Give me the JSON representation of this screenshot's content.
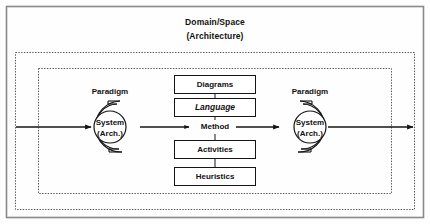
{
  "figure": {
    "title_line1": "Domain/Space",
    "title_line2": "(Architecture)",
    "colors": {
      "stroke": "#141414",
      "frame": "#8a8a8a",
      "background": "#fefefe",
      "dashed": "#555555"
    }
  },
  "left_node": {
    "paradigm_label": "Paradigm",
    "system_line1": "System",
    "system_line2": "(Arch.)"
  },
  "right_node": {
    "paradigm_label": "Paradigm",
    "system_line1": "System",
    "system_line2": "(Arch.)"
  },
  "center": {
    "method_label": "Method",
    "boxes_above": [
      {
        "label": "Diagrams",
        "style": "normal"
      },
      {
        "label": "Language",
        "style": "bold-italic"
      }
    ],
    "boxes_below": [
      {
        "label": "Activities",
        "style": "normal"
      },
      {
        "label": "Heuristics",
        "style": "normal"
      }
    ]
  }
}
